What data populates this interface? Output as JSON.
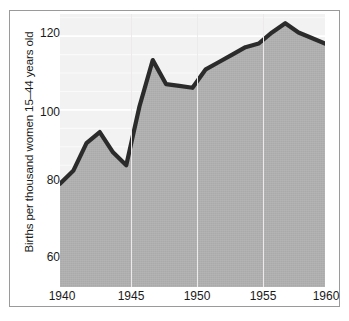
{
  "chart_data": {
    "type": "area",
    "title": "",
    "subtitle": "",
    "xlabel": "",
    "ylabel": "Births per thousand women 15–44 years old",
    "xlim": [
      1940,
      1960
    ],
    "ylim": [
      52,
      126
    ],
    "xticks": [
      1940,
      1945,
      1950,
      1955,
      1960
    ],
    "xticklabels": [
      "1940",
      "1945",
      "1950",
      "1955",
      "1960"
    ],
    "yticks": [
      60,
      80,
      100,
      120
    ],
    "yticklabels": [
      "60",
      "80",
      "100",
      "120"
    ],
    "grid": "vertical gridlines at 1945, 1950, 1955; faint horizontal bands above the series",
    "legend": "none",
    "series": [
      {
        "name": "Births per thousand women 15-44 years old",
        "x": [
          1940,
          1941,
          1942,
          1943,
          1944,
          1945,
          1946,
          1947,
          1948,
          1949,
          1950,
          1951,
          1952,
          1953,
          1954,
          1955,
          1956,
          1957,
          1958,
          1959,
          1960
        ],
        "values": [
          80,
          83.5,
          91,
          94,
          88.5,
          85,
          101,
          113.5,
          107,
          106.5,
          106,
          111,
          113,
          115,
          117,
          118,
          121,
          123.5,
          121,
          119.5,
          118
        ]
      }
    ],
    "colors": {
      "line": "#2b2b2b",
      "plot_background": "#b0b0b0",
      "above_line_background": "#f2f2f2",
      "gridline": "#eceaea",
      "frame": "#9a9a9a",
      "text": "#1a1a1a"
    }
  },
  "axis": {
    "y_title": "Births per thousand women 15–44 years old",
    "y_tick_labels": [
      "120",
      "100",
      "80",
      "60"
    ],
    "x_tick_labels": [
      "1940",
      "1945",
      "1950",
      "1955",
      "1960"
    ]
  }
}
